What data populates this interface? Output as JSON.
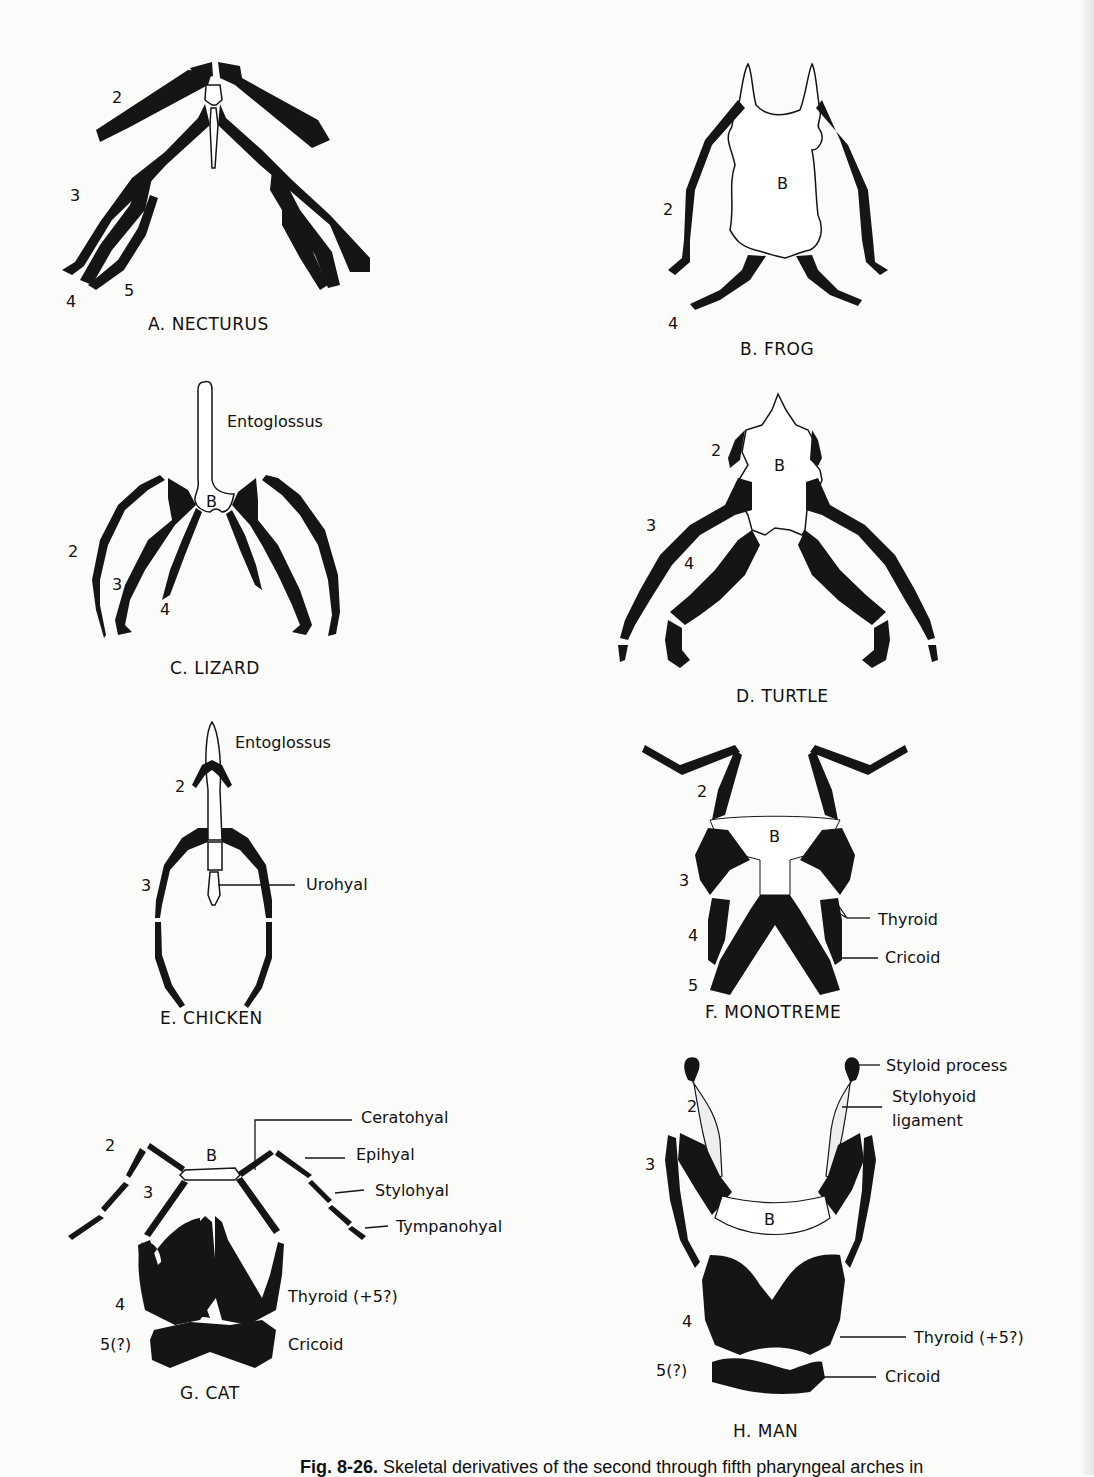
{
  "panels": [
    {
      "id": "A",
      "title": "A. NECTURUS",
      "labels": [
        "2",
        "3",
        "4",
        "5"
      ]
    },
    {
      "id": "B",
      "title": "B. FROG",
      "labels": [
        "B",
        "2",
        "4"
      ]
    },
    {
      "id": "C",
      "title": "C. LIZARD",
      "labels": [
        "Entoglossus",
        "B",
        "2",
        "3",
        "4"
      ]
    },
    {
      "id": "D",
      "title": "D. TURTLE",
      "labels": [
        "2",
        "B",
        "3",
        "4"
      ]
    },
    {
      "id": "E",
      "title": "E. CHICKEN",
      "labels": [
        "Entoglossus",
        "2",
        "3",
        "Urohyal"
      ]
    },
    {
      "id": "F",
      "title": "F. MONOTREME",
      "labels": [
        "2",
        "B",
        "3",
        "4",
        "5",
        "Thyroid",
        "Cricoid"
      ]
    },
    {
      "id": "G",
      "title": "G. CAT",
      "labels": [
        "2",
        "B",
        "3",
        "4",
        "5(?)",
        "Ceratohyal",
        "Epihyal",
        "Stylohyal",
        "Tympanohyal",
        "Thyroid (+5?)",
        "Cricoid"
      ]
    },
    {
      "id": "H",
      "title": "H. MAN",
      "labels": [
        "Styloid process",
        "Stylohyoid",
        "ligament",
        "2",
        "3",
        "B",
        "4",
        "5(?)",
        "Thyroid (+5?)",
        "Cricoid"
      ]
    }
  ],
  "caption": {
    "fig": "Fig. 8-26.",
    "text": "Skeletal derivatives of the second through fifth pharyngeal arches in"
  }
}
